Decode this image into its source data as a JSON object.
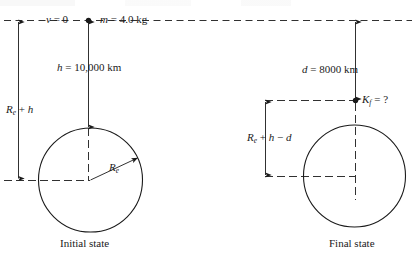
{
  "figure": {
    "stroke_color": "#1a1a1a",
    "background_color": "#ffffff"
  },
  "initial_state": {
    "caption": "Initial state",
    "velocity_label": "v = 0",
    "mass_label": "m = 4.0 kg",
    "mass_value": "4.0",
    "mass_unit": "kg",
    "height_label": "h = 10,000 km",
    "height_value": "10,000",
    "height_unit": "km",
    "distance_label": "Re + h",
    "radius_label": "Re",
    "radius_symbol": "R",
    "radius_subscript": "e"
  },
  "final_state": {
    "caption": "Final state",
    "drop_label": "d = 8000 km",
    "drop_value": "8000",
    "drop_unit": "km",
    "kinetic_energy_label": "Kf = ?",
    "kinetic_symbol": "K",
    "kinetic_subscript": "f",
    "kinetic_value": "?",
    "distance_label": "Re + h − d"
  }
}
